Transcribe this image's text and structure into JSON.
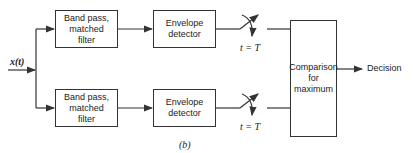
{
  "diagram": {
    "input_label": "x(t)",
    "branches": [
      {
        "filter_label": "Band pass,\nmatched\nfilter",
        "detector_label": "Envelope\ndetector",
        "switch_label": "t = T"
      },
      {
        "filter_label": "Band pass,\nmatched\nfilter",
        "detector_label": "Envelope\ndetector",
        "switch_label": "t = T"
      }
    ],
    "comparator_label": "Comparison\nfor\nmaximum",
    "output_label": "Decision",
    "caption": "(b)"
  },
  "colors": {
    "line": "#333333",
    "background": "#ffffff"
  }
}
